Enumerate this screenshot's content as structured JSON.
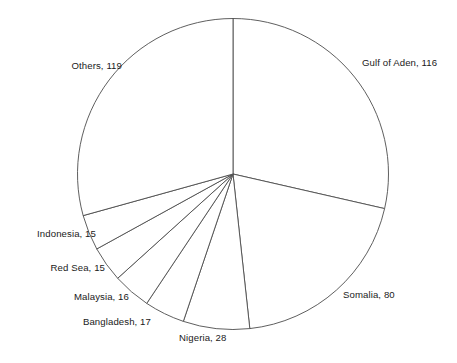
{
  "chart_data": {
    "type": "pie",
    "title": "",
    "subtitle": "",
    "xlabel": "",
    "ylabel": "",
    "total": 406,
    "start_angle_deg": 0,
    "direction": "clockwise",
    "grid": false,
    "legend_position": "none",
    "label_format": "name, value",
    "categories": [
      "Gulf of Aden",
      "Somalia",
      "Nigeria",
      "Bangladesh",
      "Malaysia",
      "Red Sea",
      "Indonesia",
      "Others"
    ],
    "values": [
      116,
      80,
      28,
      17,
      16,
      15,
      15,
      119
    ],
    "slices": [
      {
        "name": "Gulf of Aden",
        "value": 116,
        "label": "Gulf of Aden, 116",
        "label_x": 362,
        "label_y": 63,
        "label_align": "left"
      },
      {
        "name": "Somalia",
        "value": 80,
        "label": "Somalia, 80",
        "label_x": 343,
        "label_y": 295,
        "label_align": "left"
      },
      {
        "name": "Nigeria",
        "value": 28,
        "label": "Nigeria, 28",
        "label_x": 179,
        "label_y": 338,
        "label_align": "left"
      },
      {
        "name": "Bangladesh",
        "value": 17,
        "label": "Bangladesh, 17",
        "label_x": 151,
        "label_y": 322,
        "label_align": "right"
      },
      {
        "name": "Malaysia",
        "value": 16,
        "label": "Malaysia, 16",
        "label_x": 129,
        "label_y": 297,
        "label_align": "right"
      },
      {
        "name": "Red Sea",
        "value": 15,
        "label": "Red Sea, 15",
        "label_x": 105,
        "label_y": 268,
        "label_align": "right"
      },
      {
        "name": "Indonesia",
        "value": 15,
        "label": "Indonesia, 15",
        "label_x": 96,
        "label_y": 234,
        "label_align": "right"
      },
      {
        "name": "Others",
        "value": 119,
        "label": "Others, 119",
        "label_x": 122,
        "label_y": 66,
        "label_align": "right"
      }
    ]
  },
  "geometry": {
    "center_x": 233,
    "center_y": 174,
    "radius": 155.5
  },
  "style": {
    "stroke_color": "#4d4d4d",
    "fill_color": "#ffffff",
    "text_color": "#1a1a1a",
    "background": "#ffffff"
  }
}
